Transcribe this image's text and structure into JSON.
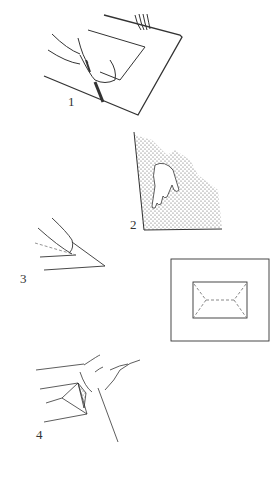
{
  "figures": [
    {
      "id": "1",
      "label": "1",
      "description": "hands pressing and cutting paper on a board",
      "label_pos": [
        68,
        96
      ]
    },
    {
      "id": "2",
      "label": "2",
      "description": "hand on stippled surface",
      "label_pos": [
        130,
        220
      ]
    },
    {
      "id": "3",
      "label": "3",
      "description": "folding a corner with fingertip",
      "label_pos": [
        20,
        275
      ]
    },
    {
      "id": "mount",
      "label": "",
      "description": "mount board with inner rectangle and dashed fold lines"
    },
    {
      "id": "4",
      "label": "4",
      "description": "hands folding corner of paper",
      "label_pos": [
        36,
        430
      ]
    }
  ],
  "colors": {
    "ink": "#333333",
    "stipple": "#555555",
    "dash": "#888888"
  }
}
